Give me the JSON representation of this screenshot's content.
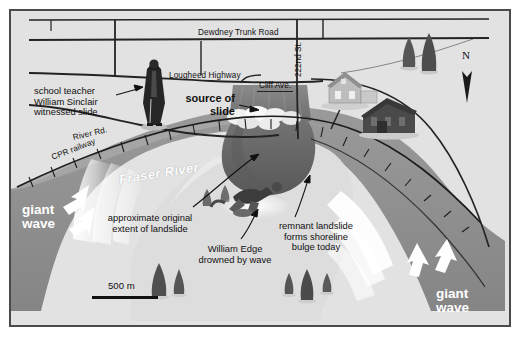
{
  "figure": {
    "kind": "illustrated-map",
    "title_visible": false,
    "border_color": "#4a4a4a",
    "background_color": "#ffffff"
  },
  "palette": {
    "land": "#e2e2e2",
    "land_shadow": "#d2d2d2",
    "water": "#8e8e8e",
    "water_light": "#a6a6a6",
    "landslide_dark": "#6d6d6d",
    "landslide_darker": "#5a5a5a",
    "bulge": "#dcdcdc",
    "road_line": "#222222",
    "wave_white": "#ffffff",
    "text": "#111111"
  },
  "roads": [
    {
      "name": "dewdney-trunk-road",
      "label": "Dewdney Trunk Road",
      "x": 196,
      "y": 23,
      "orientation": "horizontal"
    },
    {
      "name": "lougheed-highway",
      "label": "Lougheed Highway",
      "x": 167,
      "y": 66,
      "orientation": "horizontal"
    },
    {
      "name": "river-road",
      "label": "River Rd.",
      "x": 71,
      "y": 128,
      "orientation": "diagonal",
      "rotation": -13
    },
    {
      "name": "cpr-railway",
      "label": "CPR railway",
      "x": 50,
      "y": 148,
      "orientation": "diagonal",
      "rotation": -21
    },
    {
      "name": "222nd-street",
      "label": "222nd St.",
      "x": 291,
      "y": 62,
      "orientation": "vertical"
    },
    {
      "name": "cliff-avenue",
      "label": "Cliff Ave.",
      "x": 255,
      "y": 76,
      "orientation": "horizontal"
    }
  ],
  "water": {
    "river_label": "Fraser River",
    "river_label_x": 117,
    "river_label_y": 168,
    "river_label_rotation": -9
  },
  "callouts": [
    {
      "name": "school-teacher-callout",
      "lines": [
        "school teacher",
        "William Sinclair",
        "witnessed slide"
      ],
      "text": "school teacher\nWilliam Sinclair\nwitnessed slide",
      "x": 32,
      "y": 81,
      "align": "left",
      "bold": false,
      "arrow": {
        "from": [
          120,
          90
        ],
        "to": [
          146,
          85
        ]
      }
    },
    {
      "name": "source-of-slide-callout",
      "lines": [
        "source of",
        "slide"
      ],
      "text": "source of\nslide",
      "x": 181,
      "y": 87,
      "align": "right",
      "bold": true,
      "arrow": {
        "from": [
          243,
          101
        ],
        "to": [
          262,
          104
        ]
      }
    },
    {
      "name": "approximate-extent-callout",
      "lines": [
        "approximate original",
        "extent of landslide"
      ],
      "text": "approximate original\nextent of landslide",
      "x": 99,
      "y": 208,
      "align": "center",
      "bold": false,
      "arrow": {
        "from": [
          196,
          205
        ],
        "to": [
          265,
          150
        ]
      }
    },
    {
      "name": "william-edge-callout",
      "lines": [
        "William Edge",
        "drowned by wave"
      ],
      "text": "William Edge\ndrowned by wave",
      "x": 195,
      "y": 239,
      "align": "center",
      "bold": false,
      "arrow": {
        "from": [
          243,
          238
        ],
        "to": [
          262,
          212
        ]
      }
    },
    {
      "name": "remnant-landslide-callout",
      "lines": [
        "remnant landslide",
        "forms shoreline",
        "bulge today"
      ],
      "text": "remnant landslide\nforms shoreline\nbulge today",
      "x": 272,
      "y": 216,
      "align": "center",
      "bold": false,
      "arrow": {
        "from": [
          300,
          214
        ],
        "to": [
          311,
          172
        ]
      }
    }
  ],
  "wave_labels": [
    {
      "name": "giant-wave-left",
      "lines": [
        "giant",
        "wave"
      ],
      "text": "giant\nwave",
      "x": 20,
      "y": 198
    },
    {
      "name": "giant-wave-right",
      "lines": [
        "giant",
        "wave"
      ],
      "text": "giant\nwave",
      "x": 434,
      "y": 282
    }
  ],
  "scale_bar": {
    "label": "500 m",
    "length_px": 66,
    "x": 90,
    "y": 277
  },
  "compass": {
    "label": "N",
    "x": 464,
    "y": 48
  },
  "map_symbols": [
    {
      "name": "figure-william-sinclair",
      "type": "person-standing",
      "x": 150,
      "y": 72
    },
    {
      "name": "figure-william-edge",
      "type": "person-drowning",
      "x": 246,
      "y": 190
    },
    {
      "name": "house-light",
      "type": "house",
      "x": 345,
      "y": 78
    },
    {
      "name": "house-dark",
      "type": "house",
      "x": 390,
      "y": 103
    },
    {
      "name": "tree-cluster-top-right",
      "type": "trees",
      "x": 414,
      "y": 45
    },
    {
      "name": "tree-cluster-center",
      "type": "trees",
      "x": 152,
      "y": 268
    },
    {
      "name": "tree-cluster-bulge",
      "type": "trees",
      "x": 300,
      "y": 272
    },
    {
      "name": "landslide-lobe",
      "type": "landslide",
      "x": 262,
      "y": 120
    },
    {
      "name": "rubble-debris",
      "type": "rubble",
      "x": 255,
      "y": 120
    }
  ]
}
